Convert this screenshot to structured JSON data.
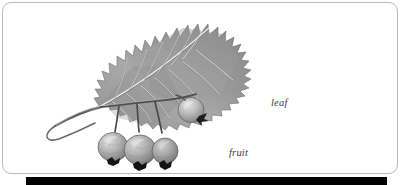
{
  "figure": {
    "labels": [
      {
        "id": "leaf",
        "text": "leaf"
      },
      {
        "id": "fruit",
        "text": "fruit"
      }
    ]
  },
  "frame": {
    "border_color": "#b9b9b9",
    "background_color": "#ffffff",
    "corner_radius_px": 9
  },
  "bottom_bar": {
    "color": "#000000"
  },
  "palette": {
    "ink_dark": "#3a3a3a",
    "ink_mid": "#7e7e7e",
    "ink_light": "#b4b4b4",
    "label_text": "#3d3d3d"
  }
}
